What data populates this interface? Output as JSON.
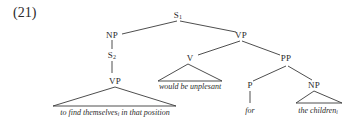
{
  "example_number": "(21)",
  "tree": {
    "root": {
      "label": "S",
      "subscript": "1"
    },
    "np_subject": {
      "label": "NP"
    },
    "s2": {
      "label": "S",
      "subscript": "2"
    },
    "vp_embedded": {
      "label": "VP"
    },
    "vp_main": {
      "label": "VP"
    },
    "v": {
      "label": "V"
    },
    "pp": {
      "label": "PP"
    },
    "p": {
      "label": "P"
    },
    "np_object": {
      "label": "NP"
    },
    "leaves": {
      "embedded_vp_text": "to find themselves",
      "embedded_vp_index": "i",
      "embedded_vp_rest": " in that position",
      "v_text": "would be unplesant",
      "p_text": "for",
      "np_object_text": "the children",
      "np_object_index": "i"
    }
  }
}
